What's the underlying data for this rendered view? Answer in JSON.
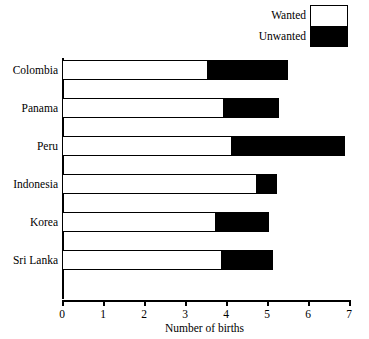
{
  "chart_data": {
    "type": "bar",
    "orientation": "horizontal",
    "stacked": true,
    "title": "",
    "xlabel": "Number of births",
    "ylabel": "",
    "xlim": [
      0,
      7
    ],
    "xticks": [
      0,
      1,
      2,
      3,
      4,
      5,
      6,
      7
    ],
    "xtick_labels": [
      "0",
      "1",
      "2",
      "3",
      "4",
      "5",
      "6",
      "7"
    ],
    "grid": false,
    "legend_position": "top-right",
    "categories": [
      "Colombia",
      "Panama",
      "Peru",
      "Indonesia",
      "Korea",
      "Sri Lanka"
    ],
    "series": [
      {
        "name": "Wanted",
        "color": "#ffffff",
        "values": [
          3.5,
          3.9,
          4.1,
          4.7,
          3.7,
          3.85
        ]
      },
      {
        "name": "Unwanted",
        "color": "#000000",
        "values": [
          2.0,
          1.4,
          2.8,
          0.55,
          1.35,
          1.3
        ]
      }
    ],
    "totals": [
      5.5,
      5.3,
      6.9,
      5.25,
      5.05,
      5.15
    ]
  },
  "legend": {
    "wanted_label": "Wanted",
    "unwanted_label": "Unwanted"
  },
  "axis": {
    "x_title": "Number of births"
  }
}
